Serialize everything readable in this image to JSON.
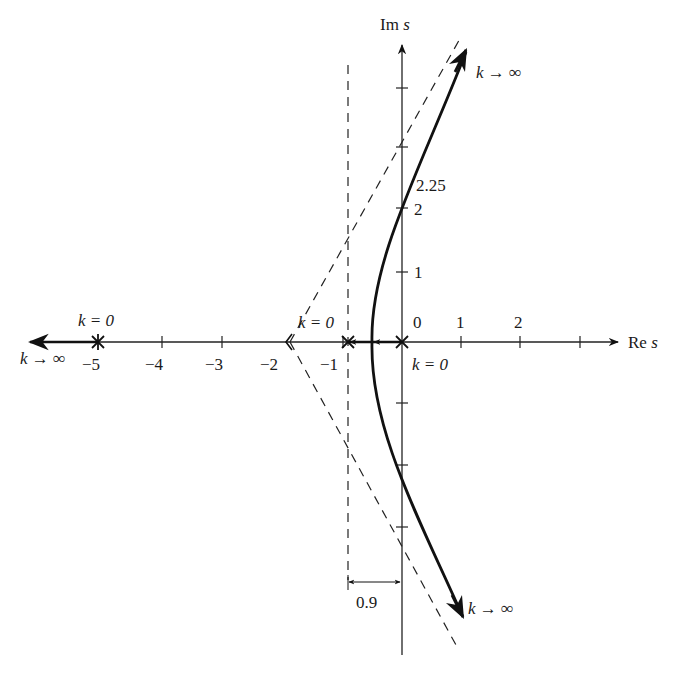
{
  "diagram": {
    "type": "root-locus",
    "axes": {
      "x_label_main": "Re",
      "x_label_var": "s",
      "y_label_main": "Im",
      "y_label_var": "s",
      "x_ticks": [
        {
          "value": -5,
          "label": "−5"
        },
        {
          "value": -4,
          "label": "−4"
        },
        {
          "value": -3,
          "label": "−3"
        },
        {
          "value": -2,
          "label": "−2"
        },
        {
          "value": -1,
          "label": "−1"
        },
        {
          "value": 0,
          "label": "0"
        },
        {
          "value": 1,
          "label": "1"
        },
        {
          "value": 2,
          "label": "2"
        }
      ],
      "y_ticks": [
        {
          "value": 1,
          "label": "1"
        },
        {
          "value": 2,
          "label": "2"
        }
      ],
      "y_crossing_label": "2.25"
    },
    "poles": [
      {
        "s": -5,
        "label": "k = 0"
      },
      {
        "s": -0.9,
        "label": "k = 0"
      },
      {
        "s": 0,
        "label": "k = 0"
      }
    ],
    "asymptote_centroid": -1.9,
    "annotations": {
      "k_inf_top": "k → ∞",
      "k_inf_left": "k → ∞",
      "k_inf_bottom": "k → ∞",
      "k0_left": "k = 0",
      "k0_mid": "k = 0",
      "k0_origin": "k = 0",
      "dimension": "0.9"
    }
  }
}
